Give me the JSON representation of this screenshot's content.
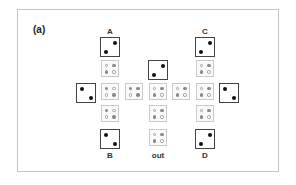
{
  "panel_label": "(a)",
  "labels": {
    "A": "A",
    "B": "B",
    "C": "C",
    "D": "D",
    "out": "out"
  },
  "legend_semantics": {
    "dark_box": "terminal square with two filled dots on a diagonal",
    "gray_box": "intermediate square with two filled (gray) and two open dots"
  },
  "colors": {
    "frame_border": "#c4c4c4",
    "dark_box_border": "#444444",
    "gray_box_border": "#c9c9c9",
    "filled_dot_dark": "#111111",
    "filled_dot_gray": "#8a8a8a"
  }
}
